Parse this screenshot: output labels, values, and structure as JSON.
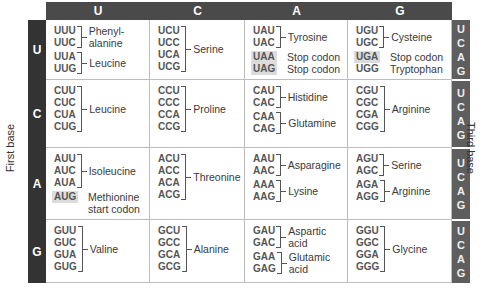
{
  "axes": {
    "first_base_label": "First base",
    "third_base_label": "Third base",
    "second_base_headers": [
      "U",
      "C",
      "A",
      "G"
    ],
    "first_base_rows": [
      "U",
      "C",
      "A",
      "G"
    ],
    "third_base_letters": [
      "U",
      "C",
      "A",
      "G"
    ]
  },
  "colors": {
    "header_bg": "#4a4a4a",
    "first_base_bg": "#333333",
    "third_base_bg": "#5e5e5e",
    "highlight": "#dcdcdc"
  },
  "table": {
    "U": {
      "U": [
        {
          "codons": [
            "UUU",
            "UUC"
          ],
          "amino_acid": "Phenyl-\nalanine"
        },
        {
          "codons": [
            "UUA",
            "UUG"
          ],
          "amino_acid": "Leucine"
        }
      ],
      "C": [
        {
          "codons": [
            "UCU",
            "UCC",
            "UCA",
            "UCG"
          ],
          "amino_acid": "Serine"
        }
      ],
      "A": [
        {
          "codons": [
            "UAU",
            "UAC"
          ],
          "amino_acid": "Tyrosine"
        },
        {
          "codons": [
            "UAA"
          ],
          "amino_acid": "Stop codon",
          "highlight": true
        },
        {
          "codons": [
            "UAG"
          ],
          "amino_acid": "Stop codon",
          "highlight": true
        }
      ],
      "G": [
        {
          "codons": [
            "UGU",
            "UGC"
          ],
          "amino_acid": "Cysteine"
        },
        {
          "codons": [
            "UGA"
          ],
          "amino_acid": "Stop codon",
          "highlight": true
        },
        {
          "codons": [
            "UGG"
          ],
          "amino_acid": "Tryptophan"
        }
      ]
    },
    "C": {
      "U": [
        {
          "codons": [
            "CUU",
            "CUC",
            "CUA",
            "CUG"
          ],
          "amino_acid": "Leucine"
        }
      ],
      "C": [
        {
          "codons": [
            "CCU",
            "CCC",
            "CCA",
            "CCG"
          ],
          "amino_acid": "Proline"
        }
      ],
      "A": [
        {
          "codons": [
            "CAU",
            "CAC"
          ],
          "amino_acid": "Histidine"
        },
        {
          "codons": [
            "CAA",
            "CAG"
          ],
          "amino_acid": "Glutamine"
        }
      ],
      "G": [
        {
          "codons": [
            "CGU",
            "CGC",
            "CGA",
            "CGG"
          ],
          "amino_acid": "Arginine"
        }
      ]
    },
    "A": {
      "U": [
        {
          "codons": [
            "AUU",
            "AUC",
            "AUA"
          ],
          "amino_acid": "Isoleucine"
        },
        {
          "codons": [
            "AUG"
          ],
          "amino_acid": "Methionine\nstart codon",
          "highlight": true
        }
      ],
      "C": [
        {
          "codons": [
            "ACU",
            "ACC",
            "ACA",
            "ACG"
          ],
          "amino_acid": "Threonine"
        }
      ],
      "A": [
        {
          "codons": [
            "AAU",
            "AAC"
          ],
          "amino_acid": "Asparagine"
        },
        {
          "codons": [
            "AAA",
            "AAG"
          ],
          "amino_acid": "Lysine"
        }
      ],
      "G": [
        {
          "codons": [
            "AGU",
            "AGC"
          ],
          "amino_acid": "Serine"
        },
        {
          "codons": [
            "AGA",
            "AGG"
          ],
          "amino_acid": "Arginine"
        }
      ]
    },
    "G": {
      "U": [
        {
          "codons": [
            "GUU",
            "GUC",
            "GUA",
            "GUG"
          ],
          "amino_acid": "Valine"
        }
      ],
      "C": [
        {
          "codons": [
            "GCU",
            "GCC",
            "GCA",
            "GCG"
          ],
          "amino_acid": "Alanine"
        }
      ],
      "A": [
        {
          "codons": [
            "GAU",
            "GAC"
          ],
          "amino_acid": "Aspartic\nacid"
        },
        {
          "codons": [
            "GAA",
            "GAG"
          ],
          "amino_acid": "Glutamic\nacid"
        }
      ],
      "G": [
        {
          "codons": [
            "GGU",
            "GGC",
            "GGA",
            "GGG"
          ],
          "amino_acid": "Glycine"
        }
      ]
    }
  }
}
